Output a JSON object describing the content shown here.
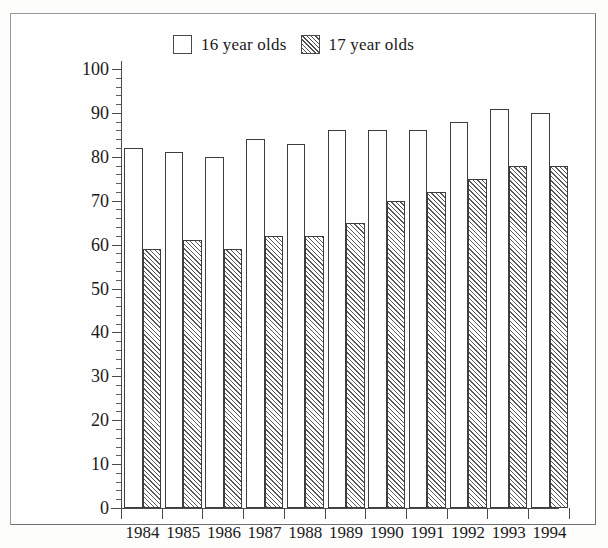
{
  "chart_data": {
    "type": "bar",
    "title": "",
    "subtitle": "",
    "xlabel": "",
    "ylabel": "",
    "ylim": [
      0,
      100
    ],
    "ytick_step": 10,
    "yminor_step": 2,
    "grid": false,
    "legend_position": "top-center",
    "categories": [
      "1984",
      "1985",
      "1986",
      "1987",
      "1988",
      "1989",
      "1990",
      "1991",
      "1992",
      "1993",
      "1994"
    ],
    "ytick_labels": [
      "0",
      "10",
      "20",
      "30",
      "40",
      "50",
      "60",
      "70",
      "80",
      "90",
      "100"
    ],
    "series": [
      {
        "name": "16 year olds",
        "fill": "white",
        "values": [
          82,
          81,
          80,
          84,
          83,
          86,
          86,
          86,
          88,
          91,
          90
        ]
      },
      {
        "name": "17 year olds",
        "fill": "hatched",
        "values": [
          59,
          61,
          59,
          62,
          62,
          65,
          70,
          72,
          75,
          78,
          78
        ]
      }
    ]
  },
  "legend": {
    "entries": [
      {
        "label": "16 year olds",
        "swatch": "empty-square-swatch"
      },
      {
        "label": "17 year olds",
        "swatch": "hatched-square-swatch"
      }
    ]
  },
  "colors": {
    "outline": "#3d3d3d",
    "axis": "#4a4a4a",
    "hatch": "#5a5a5a",
    "background": "#fefefe",
    "page": "#fdfdfc"
  }
}
